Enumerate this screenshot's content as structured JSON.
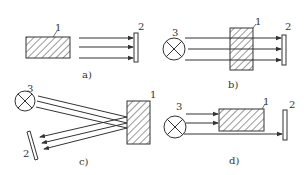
{
  "diagram": {
    "colors": {
      "stroke": "#333333",
      "background": "#ffffff"
    },
    "legend_numbers": {
      "object": "1",
      "receiver": "2",
      "light_source": "3"
    },
    "panels": [
      {
        "id": "a",
        "caption": "a)",
        "labels": {
          "object": "1",
          "receiver": "2"
        },
        "mode": "radiation-from-object"
      },
      {
        "id": "b",
        "caption": "b)",
        "labels": {
          "source": "3",
          "object": "1",
          "receiver": "2"
        },
        "mode": "transmission-through-object"
      },
      {
        "id": "c",
        "caption": "c)",
        "labels": {
          "source": "3",
          "object": "1",
          "receiver": "2"
        },
        "mode": "reflection-from-object"
      },
      {
        "id": "d",
        "caption": "d)",
        "labels": {
          "source": "3",
          "object": "1",
          "receiver": "2"
        },
        "mode": "beam-blocking-by-object"
      }
    ]
  }
}
